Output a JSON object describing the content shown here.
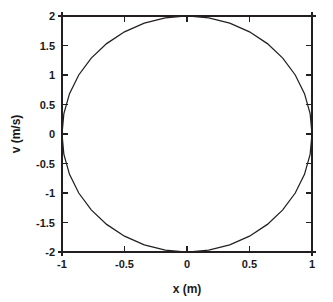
{
  "chart_data": {
    "type": "line",
    "title": "",
    "subtitle": "",
    "xlabel": "x (m)",
    "ylabel": "v (m/s)",
    "xlim": [
      -1,
      1
    ],
    "ylim": [
      -2,
      2
    ],
    "grid": false,
    "legend": false,
    "legend_position": "none",
    "xticks": [
      -1,
      -0.5,
      0,
      0.5,
      1
    ],
    "xticklabels": [
      "-1",
      "-0.5",
      "0",
      "0.5",
      "1"
    ],
    "yticks": [
      -2,
      -1.5,
      -1,
      -0.5,
      0,
      0.5,
      1,
      1.5,
      2
    ],
    "yticklabels": [
      "-2",
      "-1.5",
      "-1",
      "-0.5",
      "0",
      "0.5",
      "1",
      "1.5",
      "2"
    ],
    "annotations": [],
    "series": [
      {
        "name": "phase-space trajectory",
        "description": "closed elliptical orbit, x amplitude 1 m, v amplitude 2 m/s",
        "shape": "ellipse",
        "center": [
          0,
          0
        ],
        "x_amplitude": 1,
        "v_amplitude": 2,
        "color": "#231f20",
        "x": [
          1,
          0.985,
          0.94,
          0.866,
          0.766,
          0.643,
          0.5,
          0.342,
          0.174,
          0,
          -0.174,
          -0.342,
          -0.5,
          -0.643,
          -0.766,
          -0.866,
          -0.94,
          -0.985,
          -1,
          -0.985,
          -0.94,
          -0.866,
          -0.766,
          -0.643,
          -0.5,
          -0.342,
          -0.174,
          0,
          0.174,
          0.342,
          0.5,
          0.643,
          0.766,
          0.866,
          0.94,
          0.985,
          1
        ],
        "values": [
          0,
          0.347,
          0.684,
          1,
          1.286,
          1.532,
          1.732,
          1.879,
          1.97,
          2,
          1.97,
          1.879,
          1.732,
          1.532,
          1.286,
          1,
          0.684,
          0.347,
          0,
          -0.347,
          -0.684,
          -1,
          -1.286,
          -1.532,
          -1.732,
          -1.879,
          -1.97,
          -2,
          -1.97,
          -1.879,
          -1.732,
          -1.532,
          -1.286,
          -1,
          -0.684,
          -0.347,
          0
        ]
      }
    ]
  },
  "axes": {
    "x_axis_title": "x (m)",
    "y_axis_title": "v (m/s)"
  },
  "ticks": {
    "x": [
      {
        "value": "-1",
        "pos": -1
      },
      {
        "value": "-0.5",
        "pos": -0.5
      },
      {
        "value": "0",
        "pos": 0
      },
      {
        "value": "0.5",
        "pos": 0.5
      },
      {
        "value": "1",
        "pos": 1
      }
    ],
    "y": [
      {
        "value": "2",
        "pos": 2
      },
      {
        "value": "1.5",
        "pos": 1.5
      },
      {
        "value": "1",
        "pos": 1
      },
      {
        "value": "0.5",
        "pos": 0.5
      },
      {
        "value": "0",
        "pos": 0
      },
      {
        "value": "-0.5",
        "pos": -0.5
      },
      {
        "value": "-1",
        "pos": -1
      },
      {
        "value": "-1.5",
        "pos": -1.5
      },
      {
        "value": "-2",
        "pos": -2
      }
    ]
  },
  "style": {
    "line_color": "#231f20",
    "frame_color": "#231f20",
    "text_color": "#1a1a1a",
    "background": "#ffffff"
  }
}
